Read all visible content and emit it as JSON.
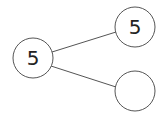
{
  "diagram": {
    "type": "tree",
    "colors": {
      "stroke": "#555555",
      "text": "#222222",
      "fill": "#ffffff"
    },
    "nodes": [
      {
        "id": "root",
        "label": "5",
        "cx": 33,
        "cy": 58,
        "r": 20
      },
      {
        "id": "child_top",
        "label": "5",
        "cx": 135,
        "cy": 27,
        "r": 20
      },
      {
        "id": "child_bottom",
        "label": "",
        "cx": 135,
        "cy": 91,
        "r": 20
      }
    ],
    "edges": [
      {
        "from": "root",
        "to": "child_top"
      },
      {
        "from": "root",
        "to": "child_bottom"
      }
    ]
  }
}
